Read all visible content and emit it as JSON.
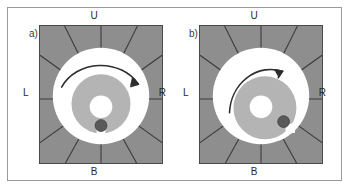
{
  "figure": {
    "border_color": "#9a9a9a",
    "background": "#ffffff"
  },
  "colors": {
    "field_gray": "#8e8e8e",
    "field_outline": "#4a4a4a",
    "spoke_line": "#3b3b3b",
    "annulus_white": "#ffffff",
    "inner_disc_gray": "#b4b4b4",
    "center_hole": "#ffffff",
    "marker_dot": "#5a5a5a",
    "marker_square": "#ffffff",
    "arrow": "#2e2e2e",
    "text": "#2a2a2a"
  },
  "panels": [
    {
      "id": "a",
      "label": "a)",
      "directions": {
        "up": "U",
        "left": "L",
        "right": "R",
        "bottom": "B"
      },
      "marker": {
        "position": "bottom",
        "angle_deg": 90,
        "dot_name": "marker-dot",
        "square_name": "marker-square"
      },
      "arrow": {
        "name": "rotation-arrow",
        "direction": "clockwise",
        "sweep": "long",
        "start_deg": 190,
        "end_deg": 350
      },
      "spokes": 12,
      "inner_disc": {
        "cx_offset": 0,
        "cy_offset": 6
      }
    },
    {
      "id": "b",
      "label": "b)",
      "directions": {
        "up": "U",
        "left": "L",
        "right": "R",
        "bottom": "B"
      },
      "marker": {
        "position": "lower-right",
        "angle_deg": 45,
        "dot_name": "marker-dot",
        "square_name": "marker-square"
      },
      "arrow": {
        "name": "rotation-arrow",
        "direction": "clockwise",
        "sweep": "short",
        "start_deg": 195,
        "end_deg": 305
      },
      "spokes": 12,
      "inner_disc": {
        "cx_offset": 2,
        "cy_offset": 10
      }
    }
  ]
}
